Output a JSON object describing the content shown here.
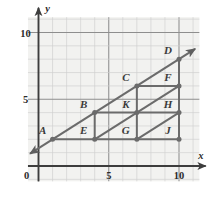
{
  "figure": {
    "kind": "coordinate-grid-geometry",
    "background": "#ffffff",
    "grid_fill": "#f2f2f0",
    "grid_minor_color": "#cfcfcf",
    "grid_major_color": "#8e8e8e",
    "axis_color": "#3d3d3d",
    "shape_color": "#6b6b6b",
    "label_color": "#3a3a3a",
    "x_axis_label": "x",
    "y_axis_label": "y",
    "origin_label": "0",
    "x_ticks": [
      {
        "value": 5,
        "label": "5"
      },
      {
        "value": 10,
        "label": "10"
      }
    ],
    "y_ticks": [
      {
        "value": 5,
        "label": "5"
      },
      {
        "value": 10,
        "label": "10"
      }
    ],
    "x_range": [
      -0.8,
      11.4
    ],
    "y_range": [
      -1.2,
      11.2
    ]
  },
  "chart_data": {
    "type": "scatter",
    "title": "",
    "xlabel": "x",
    "ylabel": "y",
    "xlim": [
      0,
      11
    ],
    "ylim": [
      0,
      11
    ],
    "grid": true,
    "points": [
      {
        "label": "A",
        "x": 1,
        "y": 2
      },
      {
        "label": "B",
        "x": 4,
        "y": 4
      },
      {
        "label": "C",
        "x": 7,
        "y": 6
      },
      {
        "label": "D",
        "x": 10,
        "y": 8
      },
      {
        "label": "E",
        "x": 4,
        "y": 2
      },
      {
        "label": "F",
        "x": 10,
        "y": 6
      },
      {
        "label": "G",
        "x": 7,
        "y": 2
      },
      {
        "label": "H",
        "x": 10,
        "y": 4
      },
      {
        "label": "J",
        "x": 10,
        "y": 2
      },
      {
        "label": "K",
        "x": 7,
        "y": 4
      }
    ],
    "segments": [
      {
        "name": "main-diagonal-ray",
        "from": [
          -0.6,
          0.93
        ],
        "to": [
          11.15,
          8.77
        ],
        "arrow": "both"
      },
      {
        "name": "diagonal-E-F",
        "from": [
          4,
          2
        ],
        "to": [
          10,
          6
        ],
        "arrow": "none"
      },
      {
        "name": "diagonal-G-H",
        "from": [
          7,
          2
        ],
        "to": [
          10,
          4
        ],
        "arrow": "none"
      },
      {
        "name": "horizontal-A-J",
        "from": [
          1,
          2
        ],
        "to": [
          10,
          2
        ],
        "arrow": "none"
      },
      {
        "name": "horizontal-B-H",
        "from": [
          4,
          4
        ],
        "to": [
          10,
          4
        ],
        "arrow": "none"
      },
      {
        "name": "horizontal-C-F",
        "from": [
          7,
          6
        ],
        "to": [
          10,
          6
        ],
        "arrow": "none"
      },
      {
        "name": "vertical-E-B",
        "from": [
          4,
          2
        ],
        "to": [
          4,
          4
        ],
        "arrow": "none"
      },
      {
        "name": "vertical-G-C",
        "from": [
          7,
          2
        ],
        "to": [
          7,
          6
        ],
        "arrow": "none"
      },
      {
        "name": "vertical-J-D",
        "from": [
          10,
          2
        ],
        "to": [
          10,
          8
        ],
        "arrow": "none"
      }
    ],
    "annotations": [
      {
        "text": "A",
        "x": 1,
        "y": 2,
        "dx": -10,
        "dy": -5
      },
      {
        "text": "B",
        "x": 4,
        "y": 4,
        "dx": -11,
        "dy": -5
      },
      {
        "text": "C",
        "x": 7,
        "y": 6,
        "dx": -11,
        "dy": -5
      },
      {
        "text": "D",
        "x": 10,
        "y": 8,
        "dx": -11,
        "dy": -5
      },
      {
        "text": "E",
        "x": 4,
        "y": 2,
        "dx": -11,
        "dy": -5
      },
      {
        "text": "F",
        "x": 10,
        "y": 6,
        "dx": -11,
        "dy": -5
      },
      {
        "text": "G",
        "x": 7,
        "y": 2,
        "dx": -11,
        "dy": -5
      },
      {
        "text": "H",
        "x": 10,
        "y": 4,
        "dx": -11,
        "dy": -5
      },
      {
        "text": "J",
        "x": 10,
        "y": 2,
        "dx": -11,
        "dy": -5
      },
      {
        "text": "K",
        "x": 7,
        "y": 4,
        "dx": -11,
        "dy": -5
      }
    ]
  },
  "labels": {
    "A": "A",
    "B": "B",
    "C": "C",
    "D": "D",
    "E": "E",
    "F": "F",
    "G": "G",
    "H": "H",
    "J": "J",
    "K": "K",
    "tick_x_5": "5",
    "tick_x_10": "10",
    "tick_y_5": "5",
    "tick_y_10": "10",
    "origin": "0",
    "axis_x": "x",
    "axis_y": "y"
  }
}
